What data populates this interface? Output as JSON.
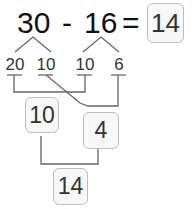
{
  "equation": {
    "minuend": "30",
    "operator": "-",
    "subtrahend": "16",
    "equals": "=",
    "answer": "14"
  },
  "decomposition": {
    "minuend_parts": [
      "20",
      "10"
    ],
    "subtrahend_parts": [
      "10",
      "6"
    ]
  },
  "steps": {
    "first_result": "10",
    "second_result": "4",
    "final_result": "14"
  },
  "colors": {
    "line": "#555555",
    "box_border": "#bdbdbd",
    "box_fill": "#f7f7f7",
    "text": "#333333"
  }
}
